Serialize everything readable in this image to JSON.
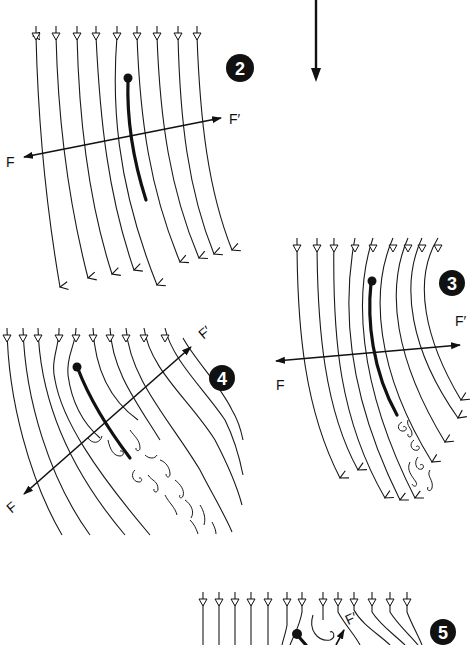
{
  "figure": {
    "main_arrow": {
      "x": 316,
      "y1": 0,
      "y2": 82
    },
    "panels": [
      {
        "number": "2",
        "badge": {
          "cx": 240,
          "cy": 68,
          "r": 14
        },
        "label_f": {
          "text": "F",
          "x": 6,
          "y": 167
        },
        "label_fprime": {
          "text": "F′",
          "x": 229,
          "y": 124
        },
        "axis": {
          "x1": 24,
          "y1": 157,
          "x2": 221,
          "y2": 118
        }
      },
      {
        "number": "3",
        "badge": {
          "cx": 452,
          "cy": 283,
          "r": 13
        },
        "label_f": {
          "text": "F",
          "x": 276,
          "y": 390
        },
        "label_fprime": {
          "text": "F′",
          "x": 455,
          "y": 326
        },
        "axis": {
          "x1": 276,
          "y1": 361,
          "x2": 460,
          "y2": 345
        }
      },
      {
        "number": "4",
        "badge": {
          "cx": 222,
          "cy": 378,
          "r": 13
        },
        "label_f": {
          "text": "F",
          "x": 8,
          "y": 512
        },
        "label_fprime": {
          "text": "F′",
          "x": 200,
          "y": 338
        },
        "axis": {
          "x1": 24,
          "y1": 494,
          "x2": 191,
          "y2": 347
        }
      },
      {
        "number": "5",
        "badge": {
          "cx": 443,
          "cy": 632,
          "r": 13
        },
        "label_fprime": {
          "text": "F′",
          "x": 346,
          "y": 624
        }
      }
    ]
  }
}
